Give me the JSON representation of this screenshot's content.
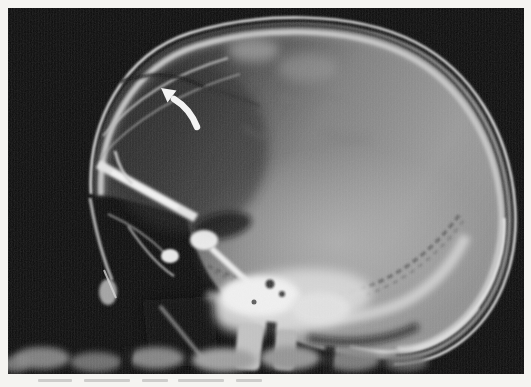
{
  "page": {
    "background_color": "#f5f4f1"
  },
  "radiograph": {
    "subject": "lateral-skull-x-ray",
    "film": {
      "background_black": "#0a0a0a",
      "bone_white": "#eaeaea",
      "intracranial_gray": "#8f8f8f"
    },
    "finding": {
      "name": "linear-lucency-frontoparietal-vault"
    },
    "arrow_annotation": {
      "style": "curved",
      "direction": "up-left",
      "color": "#f3f3f3"
    }
  }
}
